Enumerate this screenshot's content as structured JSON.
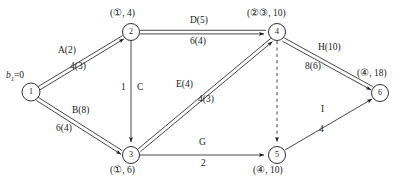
{
  "diagram": {
    "nodes": [
      {
        "id": "1",
        "label": "1",
        "x": 31,
        "y": 92,
        "r": 9,
        "annotation": "b₁=0",
        "annotation_kind": "supply",
        "ann_x": 6,
        "ann_y": 71
      },
      {
        "id": "2",
        "label": "2",
        "x": 131,
        "y": 32,
        "r": 8.5,
        "annotation": "(①, 4)",
        "annotation_kind": "label",
        "ann_x": 110,
        "ann_y": 9
      },
      {
        "id": "3",
        "label": "3",
        "x": 131,
        "y": 155,
        "r": 8.5,
        "annotation": "(①, 6)",
        "annotation_kind": "label",
        "ann_x": 110,
        "ann_y": 168
      },
      {
        "id": "4",
        "label": "4",
        "x": 277,
        "y": 32,
        "r": 8.5,
        "annotation": "(②③, 10)",
        "annotation_kind": "label",
        "ann_x": 247,
        "ann_y": 9
      },
      {
        "id": "5",
        "label": "5",
        "x": 277,
        "y": 155,
        "r": 8.5,
        "annotation": "(④, 10)",
        "annotation_kind": "label",
        "ann_x": 253,
        "ann_y": 168
      },
      {
        "id": "6",
        "label": "6",
        "x": 380,
        "y": 93,
        "r": 8.5,
        "annotation": "(④, 18)",
        "annotation_kind": "label",
        "ann_x": 357,
        "ann_y": 70
      }
    ],
    "edges": [
      {
        "id": "e-1-2",
        "from": "1",
        "to": "2",
        "style": "double",
        "name": "A(2)",
        "name_x": 58,
        "name_y": 51,
        "flow": "4(3)",
        "flow_x": 70,
        "flow_y": 66
      },
      {
        "id": "e-1-3",
        "from": "1",
        "to": "3",
        "style": "double",
        "name": "B(8)",
        "name_x": 72,
        "name_y": 110,
        "flow": "6(4)",
        "flow_x": 56,
        "flow_y": 128
      },
      {
        "id": "e-2-4",
        "from": "2",
        "to": "4",
        "style": "double",
        "name": "D(5)",
        "name_x": 190,
        "name_y": 19,
        "flow": "6(4)",
        "flow_x": 190,
        "flow_y": 38
      },
      {
        "id": "e-2-3",
        "from": "2",
        "to": "3",
        "style": "single",
        "name": "C",
        "name_x": 137,
        "name_y": 86,
        "flow": "1",
        "flow_x": 122,
        "flow_y": 86
      },
      {
        "id": "e-3-4",
        "from": "3",
        "to": "4",
        "style": "double",
        "name": "E(4)",
        "name_x": 176,
        "name_y": 83,
        "flow": "4(3)",
        "flow_x": 198,
        "flow_y": 98
      },
      {
        "id": "e-3-5",
        "from": "3",
        "to": "5",
        "style": "single",
        "name": "G",
        "name_x": 198,
        "name_y": 141,
        "flow": "2",
        "flow_x": 201,
        "flow_y": 161
      },
      {
        "id": "e-4-6",
        "from": "4",
        "to": "6",
        "style": "double",
        "name": "H(10)",
        "name_x": 318,
        "name_y": 46,
        "flow": "8(6)",
        "flow_x": 305,
        "flow_y": 65
      },
      {
        "id": "e-5-6",
        "from": "5",
        "to": "6",
        "style": "single",
        "name": "I",
        "name_x": 320,
        "name_y": 108,
        "flow": "4",
        "flow_x": 318,
        "flow_y": 128
      },
      {
        "id": "e-4-5-dashed",
        "from": "4",
        "to": "5",
        "style": "dashed",
        "name": "",
        "name_x": 0,
        "name_y": 0,
        "flow": "",
        "flow_x": 0,
        "flow_y": 0
      }
    ],
    "colors": {
      "stroke": "#1a1a1a",
      "background": "#ffffff",
      "text": "#1a1a1a"
    }
  }
}
